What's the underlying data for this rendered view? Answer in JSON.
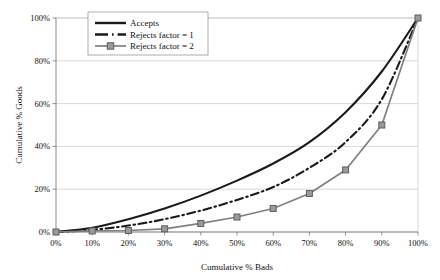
{
  "chart_data": {
    "type": "line",
    "title": "",
    "xlabel": "Cumulative % Bads",
    "ylabel": "Cumulative % Goods",
    "x": [
      0,
      10,
      20,
      30,
      40,
      50,
      60,
      70,
      80,
      90,
      100
    ],
    "xtick_labels": [
      "0%",
      "10%",
      "20%",
      "30%",
      "40%",
      "50%",
      "60%",
      "70%",
      "80%",
      "90%",
      "100%"
    ],
    "ytick_labels": [
      "0%",
      "20%",
      "40%",
      "60%",
      "80%",
      "100%"
    ],
    "ytick_values": [
      0,
      20,
      40,
      60,
      80,
      100
    ],
    "xlim": [
      0,
      100
    ],
    "ylim": [
      0,
      100
    ],
    "grid": "horizontal",
    "legend_position": "top-center",
    "series": [
      {
        "name": "Accepts",
        "style": "solid",
        "color": "#1a1a1a",
        "marker": "none",
        "values": [
          0,
          2,
          6,
          11,
          17,
          24,
          32,
          42,
          56,
          75,
          100
        ]
      },
      {
        "name": "Rejects factor = 1",
        "style": "dash-dot",
        "color": "#1a1a1a",
        "marker": "none",
        "values": [
          0,
          1,
          3,
          6,
          10,
          15,
          21,
          30,
          42,
          62,
          100
        ]
      },
      {
        "name": "Rejects factor = 2",
        "style": "solid",
        "color": "#808080",
        "marker": "square",
        "values": [
          0,
          0.5,
          0.7,
          1.5,
          4,
          7,
          11,
          18,
          29,
          50,
          100
        ]
      }
    ]
  },
  "legend": {
    "items": [
      {
        "label": "Accepts"
      },
      {
        "label": "Rejects factor = 1"
      },
      {
        "label": "Rejects factor = 2"
      }
    ]
  },
  "axes": {
    "x_title": "Cumulative % Bads",
    "y_title": "Cumulative % Goods"
  }
}
